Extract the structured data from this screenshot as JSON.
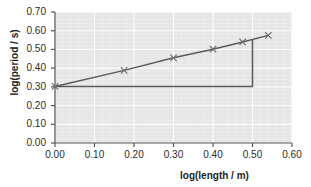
{
  "chart_data": {
    "type": "line",
    "title": "",
    "xlabel": "log(length / m)",
    "ylabel": "log(period / s)",
    "xlim": [
      0.0,
      0.6
    ],
    "ylim": [
      0.0,
      0.7
    ],
    "xticks": [
      "0.00",
      "0.10",
      "0.20",
      "0.30",
      "0.40",
      "0.50",
      "0.60"
    ],
    "yticks": [
      "0.00",
      "0.10",
      "0.20",
      "0.30",
      "0.40",
      "0.50",
      "0.60",
      "0.70"
    ],
    "xtick_values": [
      0.0,
      0.1,
      0.2,
      0.3,
      0.4,
      0.5,
      0.6
    ],
    "ytick_values": [
      0.0,
      0.1,
      0.2,
      0.3,
      0.4,
      0.5,
      0.6,
      0.7
    ],
    "grid": true,
    "grid_color": "#ffffff",
    "plot_background": "#e6e6e6",
    "legend": null,
    "series": [
      {
        "name": "measured data",
        "marker": "x",
        "line_color": "#5a5a5a",
        "marker_color": "#707070",
        "x": [
          0.0,
          0.175,
          0.3,
          0.4,
          0.475,
          0.54
        ],
        "y": [
          0.302,
          0.388,
          0.455,
          0.501,
          0.54,
          0.575
        ]
      }
    ],
    "annotations": [
      {
        "name": "gradient-triangle",
        "type": "right-triangle",
        "color": "#5a5a5a",
        "x_start": 0.0,
        "x_end": 0.5,
        "y_base": 0.302,
        "y_top": 0.553,
        "rise": 0.251,
        "run": 0.5,
        "gradient": 0.5
      }
    ]
  },
  "figure": {
    "width": 311,
    "height": 187,
    "background": "#ffffff"
  }
}
